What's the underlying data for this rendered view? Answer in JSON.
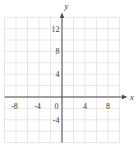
{
  "chart_data": {
    "type": "scatter",
    "title": "",
    "xlabel": "x",
    "ylabel": "y",
    "xlim": [
      -10,
      10
    ],
    "ylim": [
      -8,
      14
    ],
    "grid": true,
    "grid_step": 2,
    "tick_label_step": 4,
    "x_ticks": [
      {
        "value": -8,
        "label": "-8"
      },
      {
        "value": -4,
        "label": "-4"
      },
      {
        "value": 4,
        "label": "4"
      },
      {
        "value": 8,
        "label": "8"
      }
    ],
    "y_ticks": [
      {
        "value": -4,
        "label": "-4"
      },
      {
        "value": 4,
        "label": "4"
      },
      {
        "value": 8,
        "label": "8"
      },
      {
        "value": 12,
        "label": "12"
      }
    ],
    "origin_label": "0",
    "series": [],
    "legend": false
  },
  "colors": {
    "background": "#ffffff",
    "gridline": "#e5e4e2",
    "axis": "#4a4a4a",
    "tick_text": "#3d3d3d"
  }
}
